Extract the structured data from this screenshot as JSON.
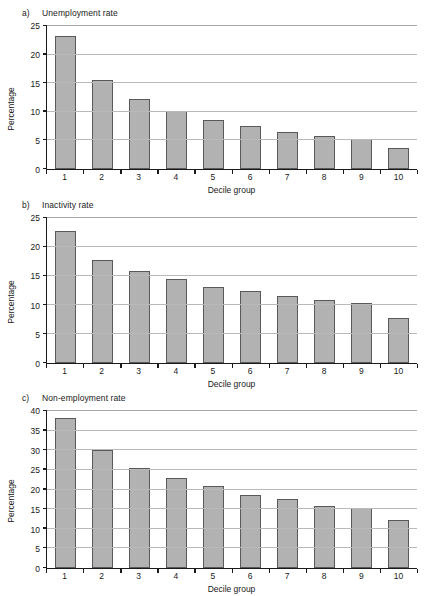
{
  "figure": {
    "bar_color": "#b2b2b2",
    "bar_border_color": "#595959",
    "grid_color": "#b9b9b9",
    "axis_color": "#1a1a1a"
  },
  "panels": [
    {
      "letter": "a)",
      "title": "Unemployment rate",
      "ylabel": "Percentage",
      "xlabel": "Decile group"
    },
    {
      "letter": "b)",
      "title": "Inactivity rate",
      "ylabel": "Percentage",
      "xlabel": "Decile group"
    },
    {
      "letter": "c)",
      "title": "Non-employment rate",
      "ylabel": "Percentage",
      "xlabel": "Decile group"
    }
  ],
  "chart_data": [
    {
      "type": "bar",
      "title": "a)  Unemployment rate",
      "xlabel": "Decile group",
      "ylabel": "Percentage",
      "categories": [
        "1",
        "2",
        "3",
        "4",
        "5",
        "6",
        "7",
        "8",
        "9",
        "10"
      ],
      "values": [
        23.2,
        15.6,
        12.3,
        10.2,
        8.6,
        7.6,
        6.4,
        5.8,
        5.3,
        3.7
      ],
      "ylim": [
        0,
        25
      ],
      "yticks": [
        0,
        5,
        10,
        15,
        20,
        25
      ],
      "grid": true,
      "legend": "none"
    },
    {
      "type": "bar",
      "title": "b)  Inactivity rate",
      "xlabel": "Decile group",
      "ylabel": "Percentage",
      "categories": [
        "1",
        "2",
        "3",
        "4",
        "5",
        "6",
        "7",
        "8",
        "9",
        "10"
      ],
      "values": [
        22.7,
        17.7,
        15.9,
        14.4,
        13.1,
        12.4,
        11.6,
        10.8,
        10.4,
        7.7
      ],
      "ylim": [
        0,
        25
      ],
      "yticks": [
        0,
        5,
        10,
        15,
        20,
        25
      ],
      "grid": true,
      "legend": "none"
    },
    {
      "type": "bar",
      "title": "c)  Non-employment rate",
      "xlabel": "Decile group",
      "ylabel": "Percentage",
      "categories": [
        "1",
        "2",
        "3",
        "4",
        "5",
        "6",
        "7",
        "8",
        "9",
        "10"
      ],
      "values": [
        38.1,
        30.0,
        25.5,
        23.0,
        20.8,
        18.5,
        17.5,
        15.8,
        15.4,
        12.3
      ],
      "ylim": [
        0,
        40
      ],
      "yticks": [
        0,
        5,
        10,
        15,
        20,
        25,
        30,
        35,
        40
      ],
      "grid": true,
      "legend": "none"
    }
  ]
}
